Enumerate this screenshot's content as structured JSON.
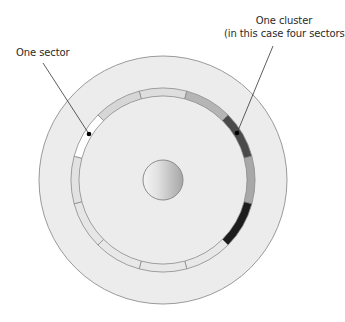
{
  "labels": {
    "sector": "One sector",
    "cluster_line1": "One cluster",
    "cluster_line2": "(in this case four sectors)"
  },
  "disk": {
    "center": [
      163,
      180
    ],
    "outer_radius": 124,
    "fill": "#ececec",
    "stroke": "#9a9a9a"
  },
  "track": {
    "outer_radius": 92,
    "inner_radius": 84,
    "sector_count": 12,
    "start_offset_deg": -15,
    "stroke": "#8a8a8a",
    "sectors": [
      {
        "index": 0,
        "fill": "#dedede",
        "role": "free"
      },
      {
        "index": 1,
        "fill": "#b5b5b5",
        "role": "used"
      },
      {
        "index": 2,
        "fill": "#4a4a4a",
        "role": "cluster"
      },
      {
        "index": 3,
        "fill": "#a8a8a8",
        "role": "cluster"
      },
      {
        "index": 4,
        "fill": "#1c1c1c",
        "role": "cluster"
      },
      {
        "index": 5,
        "fill": "#e8e8e8",
        "role": "free"
      },
      {
        "index": 6,
        "fill": "#e8e8e8",
        "role": "free"
      },
      {
        "index": 7,
        "fill": "#e8e8e8",
        "role": "free"
      },
      {
        "index": 8,
        "fill": "#e6e6e6",
        "role": "free"
      },
      {
        "index": 9,
        "fill": "#e2e2e2",
        "role": "free"
      },
      {
        "index": 10,
        "fill": "#ffffff",
        "role": "highlighted-sector"
      },
      {
        "index": 11,
        "fill": "#d6d6d6",
        "role": "free"
      }
    ]
  },
  "hub": {
    "center": [
      163,
      180
    ],
    "radius": 20,
    "gradient_light": "#f4f4f4",
    "gradient_dark": "#a6a6a6",
    "stroke": "#8c8c8c"
  },
  "leaders": [
    {
      "name": "sector-leader",
      "from": [
        43,
        63
      ],
      "to": [
        89,
        134
      ]
    },
    {
      "name": "cluster-leader",
      "from": [
        273,
        46
      ],
      "to": [
        237,
        133
      ]
    }
  ]
}
